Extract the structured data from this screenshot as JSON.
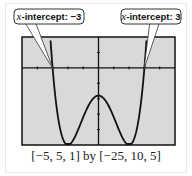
{
  "chart_data": {
    "type": "line",
    "title": "",
    "xlabel": "",
    "ylabel": "",
    "xlim": [
      -5,
      5
    ],
    "ylim": [
      -25,
      10
    ],
    "xscl": 1,
    "yscl": 5,
    "function": "y = x^4 - 8x^2 - 9",
    "x": [
      -3.2,
      -3,
      -2.5,
      -2,
      -1.5,
      -1,
      -0.5,
      0,
      0.5,
      1,
      1.5,
      2,
      2.5,
      3,
      3.2
    ],
    "values": [
      7.9,
      0,
      -19.9,
      -25,
      -21.9,
      -16,
      -10.9,
      -9,
      -10.9,
      -16,
      -21.9,
      -25,
      -19.9,
      0,
      7.9
    ],
    "grid": false,
    "annotations": [
      {
        "text": "x-intercept: −3",
        "x": -3,
        "y": 0
      },
      {
        "text": "x-intercept: 3",
        "x": 3,
        "y": 0
      }
    ]
  },
  "callouts": {
    "left": {
      "italic": "x",
      "rest": "-intercept: −3"
    },
    "right": {
      "italic": "x",
      "rest": "-intercept: 3"
    }
  },
  "caption": "[−5, 5, 1] by [−25, 10, 5]",
  "colors": {
    "screen": "#d9d9d9",
    "curve": "#111111",
    "frame": "#111111"
  }
}
